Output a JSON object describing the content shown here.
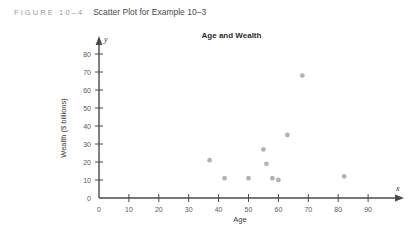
{
  "figure": {
    "label": "FIGURE 10–4",
    "caption": "Scatter Plot for Example 10–3"
  },
  "chart_data": {
    "type": "scatter",
    "title": "Age and Wealth",
    "xlabel": "Age",
    "ylabel": "Wealth ($ billions)",
    "x_var": "x",
    "y_var": "y",
    "xlim": [
      0,
      95
    ],
    "ylim": [
      0,
      85
    ],
    "xticks": [
      0,
      10,
      20,
      30,
      40,
      50,
      60,
      70,
      80,
      90
    ],
    "yticks": [
      0,
      10,
      20,
      30,
      40,
      50,
      60,
      70,
      80
    ],
    "grid": false,
    "legend": null,
    "point_color": "#b3b3b3",
    "points": [
      {
        "x": 37,
        "y": 21
      },
      {
        "x": 42,
        "y": 11
      },
      {
        "x": 50,
        "y": 11
      },
      {
        "x": 55,
        "y": 27
      },
      {
        "x": 56,
        "y": 19
      },
      {
        "x": 58,
        "y": 11
      },
      {
        "x": 60,
        "y": 10
      },
      {
        "x": 63,
        "y": 35
      },
      {
        "x": 68,
        "y": 68
      },
      {
        "x": 82,
        "y": 12
      }
    ]
  }
}
